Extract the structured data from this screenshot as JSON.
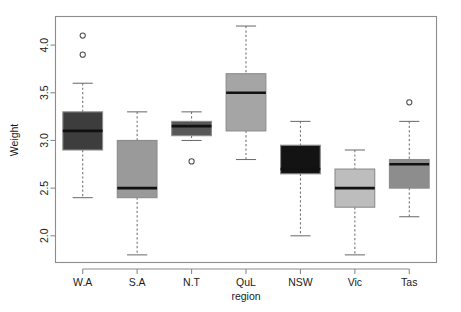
{
  "chart_data": {
    "type": "box",
    "title": "",
    "xlabel": "region",
    "ylabel": "Weight",
    "categories": [
      "W.A",
      "S.A",
      "N.T",
      "QuL",
      "NSW",
      "Vic",
      "Tas"
    ],
    "ylim": [
      1.72,
      4.3
    ],
    "yticks": [
      2.0,
      2.5,
      3.0,
      3.5,
      4.0
    ],
    "ytick_labels": [
      "2.0",
      "2.5",
      "3.0",
      "3.5",
      "4.0"
    ],
    "grid": false,
    "legend": "none",
    "boxes": [
      {
        "category": "W.A",
        "whisker_low": 2.4,
        "q1": 2.9,
        "median": 3.1,
        "q3": 3.3,
        "whisker_high": 3.6,
        "outliers": [
          3.9,
          4.1
        ],
        "fill": "#3d3d3d"
      },
      {
        "category": "S.A",
        "whisker_low": 1.8,
        "q1": 2.4,
        "median": 2.5,
        "q3": 3.0,
        "whisker_high": 3.3,
        "outliers": [],
        "fill": "#9a9a9a"
      },
      {
        "category": "N.T",
        "whisker_low": 3.0,
        "q1": 3.05,
        "median": 3.15,
        "q3": 3.2,
        "whisker_high": 3.3,
        "outliers": [
          2.78
        ],
        "fill": "#575757"
      },
      {
        "category": "QuL",
        "whisker_low": 2.8,
        "q1": 3.1,
        "median": 3.5,
        "q3": 3.7,
        "whisker_high": 4.2,
        "outliers": [],
        "fill": "#a5a5a5"
      },
      {
        "category": "NSW",
        "whisker_low": 2.0,
        "q1": 2.65,
        "median": 2.7,
        "q3": 2.95,
        "whisker_high": 3.2,
        "outliers": [],
        "fill": "#131313"
      },
      {
        "category": "Vic",
        "whisker_low": 1.8,
        "q1": 2.3,
        "median": 2.5,
        "q3": 2.7,
        "whisker_high": 2.9,
        "outliers": [],
        "fill": "#bdbdbd"
      },
      {
        "category": "Tas",
        "whisker_low": 2.2,
        "q1": 2.5,
        "median": 2.75,
        "q3": 2.8,
        "whisker_high": 3.2,
        "outliers": [
          3.4
        ],
        "fill": "#8d8d8d"
      }
    ]
  },
  "axes": {
    "y_title": "Weight",
    "x_title": "region"
  },
  "colors": {
    "frame": "#8c8c8c",
    "median": "#111111",
    "whisker": "#6e6e6e",
    "text": "#1a1a1a",
    "background": "#ffffff"
  }
}
